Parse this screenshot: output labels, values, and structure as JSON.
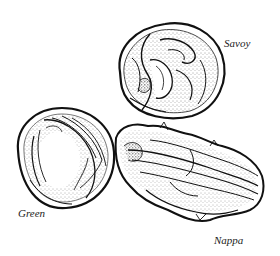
{
  "figure": {
    "type": "pen-and-ink illustration",
    "background_color": "#ffffff",
    "ink_color": "#111111",
    "items": [
      {
        "name": "Savoy",
        "label": "Savoy"
      },
      {
        "name": "Green",
        "label": "Green"
      },
      {
        "name": "Nappa",
        "label": "Nappa"
      }
    ]
  }
}
